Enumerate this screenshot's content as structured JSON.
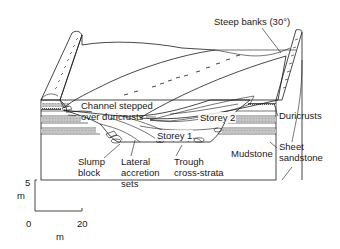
{
  "diagram": {
    "type": "geological block diagram",
    "labels": {
      "steep_banks": "Steep banks (30°)",
      "channel_stepped_1": "Channel stepped",
      "channel_stepped_2": "over duricrusts",
      "storey_2": "Storey 2",
      "storey_1": "Storey 1",
      "duricrusts": "Duricrusts",
      "sheet_1": "Sheet",
      "sheet_2": "sandstone",
      "mudstone": "Mudstone",
      "slump_1": "Slump",
      "slump_2": "block",
      "lateral_1": "Lateral",
      "lateral_2": "accretion",
      "lateral_3": "sets",
      "trough_1": "Trough",
      "trough_2": "cross-strata"
    },
    "scale": {
      "vertical_value": "5",
      "vertical_unit": "m",
      "origin": "0",
      "horizontal_value": "20",
      "horizontal_unit": "m"
    },
    "colors": {
      "ink": "#1a1a1a",
      "gravel_fill": "#8a8a8a",
      "sand_fill": "#c8c8c8",
      "band_fill": "#b8b8b8",
      "paper": "#ffffff"
    }
  }
}
